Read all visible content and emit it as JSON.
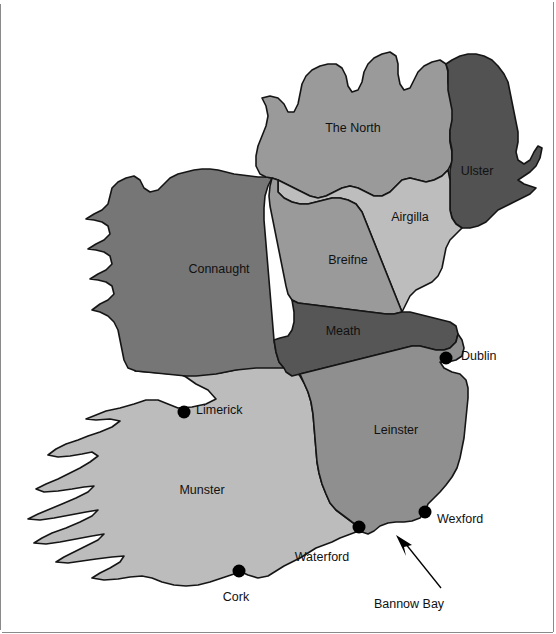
{
  "map": {
    "title": "Map of Ireland showing medieval provinces",
    "background_color": "#ffffff",
    "outline_color": "#151515",
    "regions": [
      {
        "id": "the-north",
        "label": "The North",
        "color": "#9a9a9a",
        "label_x": 353,
        "label_y": 129
      },
      {
        "id": "ulster",
        "label": "Ulster",
        "color": "#525252",
        "label_x": 477,
        "label_y": 172
      },
      {
        "id": "airgilla",
        "label": "Airgilla",
        "color": "#bdbdbd",
        "label_x": 410,
        "label_y": 218
      },
      {
        "id": "connaught",
        "label": "Connaught",
        "color": "#767676",
        "label_x": 219,
        "label_y": 270
      },
      {
        "id": "breifne",
        "label": "Breifne",
        "color": "#9a9a9a",
        "label_x": 348,
        "label_y": 261
      },
      {
        "id": "meath",
        "label": "Meath",
        "color": "#565656",
        "label_x": 343,
        "label_y": 332
      },
      {
        "id": "leinster",
        "label": "Leinster",
        "color": "#8f8f8f",
        "label_x": 396,
        "label_y": 431
      },
      {
        "id": "munster",
        "label": "Munster",
        "color": "#bcbcbc",
        "label_x": 202,
        "label_y": 491
      }
    ],
    "cities": [
      {
        "id": "dublin",
        "label": "Dublin",
        "dot_x": 446,
        "dot_y": 358,
        "label_x": 461,
        "label_y": 357
      },
      {
        "id": "limerick",
        "label": "Limerick",
        "dot_x": 184,
        "dot_y": 412,
        "label_x": 196,
        "label_y": 411
      },
      {
        "id": "wexford",
        "label": "Wexford",
        "dot_x": 425,
        "dot_y": 512,
        "label_x": 437,
        "label_y": 520
      },
      {
        "id": "waterford",
        "label": "Waterford",
        "dot_x": 359,
        "dot_y": 527,
        "label_x": 322,
        "label_y": 558
      },
      {
        "id": "cork",
        "label": "Cork",
        "dot_x": 239,
        "dot_y": 571,
        "label_x": 236,
        "label_y": 598
      }
    ],
    "annotations": [
      {
        "id": "bannow-bay",
        "label": "Bannow Bay",
        "label_x": 409,
        "label_y": 605,
        "tip_x": 398,
        "tip_y": 536,
        "tail_x": 441,
        "tail_y": 588
      }
    ]
  }
}
